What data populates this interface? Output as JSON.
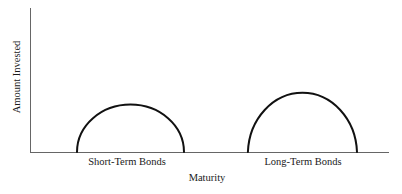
{
  "page": {
    "background_color": "#ffffff",
    "text_color": "#1a1a1a"
  },
  "chart_data": {
    "type": "area",
    "title": "",
    "xlabel": "Maturity",
    "ylabel": "Amount Invested",
    "grid": false,
    "legend": "none",
    "axis_color": "#666666",
    "curve_color": "#111111",
    "curve_stroke_width": 2,
    "x_axis_range_frac": [
      0,
      1
    ],
    "y_axis_range_frac": [
      0,
      1
    ],
    "series": [
      {
        "name": "Short-Term Bonds",
        "shape": "semi_ellipse_hump",
        "x_start_frac": 0.131,
        "x_end_frac": 0.429,
        "peak_height_frac": 0.33
      },
      {
        "name": "Long-Term Bonds",
        "shape": "semi_ellipse_hump",
        "x_start_frac": 0.607,
        "x_end_frac": 0.911,
        "peak_height_frac": 0.43
      }
    ]
  }
}
